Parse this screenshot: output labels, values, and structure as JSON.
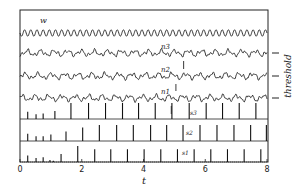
{
  "chart_data": {
    "type": "line",
    "title": "",
    "xlabel": "t",
    "ylabel": "",
    "xlim": [
      0,
      8
    ],
    "x_ticks": [
      "0",
      "2",
      "4",
      "6",
      "8"
    ],
    "x_tick_values": [
      0,
      2,
      4,
      6,
      8
    ],
    "right_label": "threshold",
    "grid": false,
    "legend": "none",
    "traces": [
      {
        "name": "w",
        "kind": "oscillation",
        "cycles_per_unit": 5.0,
        "amplitude": 1.0
      },
      {
        "name": "n3",
        "kind": "noisy-oscillation",
        "threshold_marker": true,
        "cycles_per_unit": 2.3
      },
      {
        "name": "n2",
        "kind": "noisy-oscillation",
        "threshold_marker": true,
        "cycles_per_unit": 2.3
      },
      {
        "name": "n1",
        "kind": "noisy-oscillation",
        "threshold_marker": true,
        "cycles_per_unit": 2.3
      }
    ],
    "spike_trains": [
      {
        "name": "s3",
        "times": [
          0.25,
          0.52,
          0.75,
          1.13,
          1.65,
          2.22,
          2.77,
          3.32,
          3.84,
          4.38,
          4.92,
          5.48,
          6.03,
          6.56,
          7.1,
          7.64
        ],
        "heights": [
          0.45,
          0.3,
          0.35,
          0.5,
          1,
          1,
          1,
          1,
          1,
          1,
          1,
          1,
          1,
          1,
          1,
          1
        ]
      },
      {
        "name": "s2",
        "times": [
          0.25,
          0.52,
          0.75,
          1.0,
          1.49,
          2.03,
          2.57,
          3.13,
          3.67,
          4.23,
          4.75,
          5.28,
          5.83,
          6.38,
          6.93,
          7.47,
          7.98
        ],
        "heights": [
          0.45,
          0.3,
          0.3,
          0.4,
          0.6,
          0.85,
          1,
          1,
          1,
          1,
          1,
          1,
          1,
          1,
          1,
          1,
          1
        ]
      },
      {
        "name": "s1",
        "times": [
          0.25,
          0.52,
          0.75,
          0.97,
          1.08,
          1.33,
          1.87,
          2.42,
          2.94,
          3.48,
          4.02,
          4.56,
          5.1,
          5.64,
          6.18,
          6.72,
          7.26,
          7.8
        ],
        "heights": [
          0.4,
          0.25,
          0.3,
          0.12,
          0.08,
          0.5,
          1,
          0.8,
          0.8,
          0.8,
          0.8,
          0.8,
          0.8,
          0.8,
          0.8,
          0.8,
          0.8,
          0.8
        ]
      }
    ],
    "annotations": [
      {
        "text": "|",
        "kind": "arrow",
        "near": "n2",
        "t": 5.3
      },
      {
        "text": "|",
        "kind": "arrow",
        "near": "n1",
        "t": 5.05
      },
      {
        "text": "|",
        "kind": "arrow",
        "near": "s3",
        "t": 4.9
      }
    ]
  }
}
